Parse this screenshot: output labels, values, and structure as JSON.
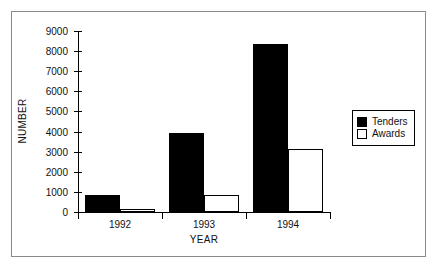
{
  "figure": {
    "frame_color": "#8a8a8a",
    "background": "#ffffff"
  },
  "chart_data": {
    "type": "bar",
    "title": "",
    "subtitle": "",
    "categories": [
      "1992",
      "1993",
      "1994"
    ],
    "series": [
      {
        "name": "Tenders",
        "values": [
          850,
          3950,
          8350
        ],
        "color": "#000000",
        "fill": "solid"
      },
      {
        "name": "Awards",
        "values": [
          150,
          850,
          3150
        ],
        "color": "#ffffff",
        "fill": "hollow"
      }
    ],
    "xlabel": "YEAR",
    "ylabel": "NUMBER",
    "ylim": [
      0,
      9000
    ],
    "yticks": [
      0,
      1000,
      2000,
      3000,
      4000,
      5000,
      6000,
      7000,
      8000,
      9000
    ],
    "ytick_labels": [
      "0",
      "1000",
      "2000",
      "3000",
      "4000",
      "5000",
      "6000",
      "7000",
      "8000",
      "9000"
    ],
    "grid": false,
    "legend_position": "right-middle",
    "legend_entries": [
      "Tenders",
      "Awards"
    ]
  },
  "axes": {
    "y_title": "NUMBER",
    "x_title": "YEAR"
  },
  "legend": {
    "items": [
      {
        "label": "Tenders",
        "swatch": "filled-square-icon"
      },
      {
        "label": "Awards",
        "swatch": "hollow-square-icon"
      }
    ]
  }
}
